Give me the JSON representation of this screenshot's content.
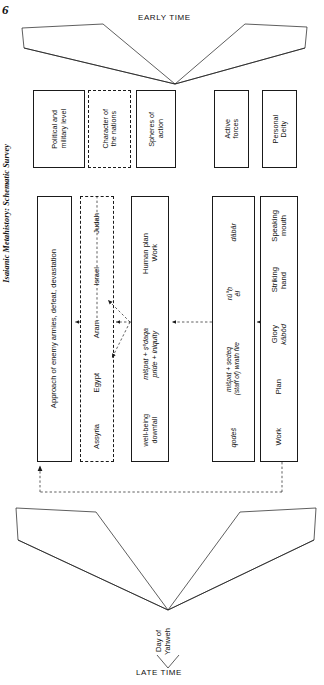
{
  "figure": {
    "number": "6",
    "caption": "Isaianic Metahistory: Schematic Survey"
  },
  "timeline": {
    "top_label": "EARLY TIME",
    "bottom_label": "LATE TIME",
    "apex_label_line1": "Day of",
    "apex_label_line2": "Yahweh"
  },
  "header_row": {
    "items": [
      {
        "id": "political-military-level",
        "line1": "Political and",
        "line2": "military level",
        "style": "solid"
      },
      {
        "id": "character-of-the-nations",
        "line1": "Character of",
        "line2": "the nations",
        "style": "dashed"
      },
      {
        "id": "spheres-of-action",
        "line1": "Spheres of",
        "line2": "action",
        "style": "solid"
      },
      {
        "id": "active-forces",
        "line1": "Active",
        "line2": "forces",
        "style": "solid"
      },
      {
        "id": "personal-deity",
        "line1": "Personal",
        "line2": "Deity",
        "style": "solid"
      }
    ]
  },
  "main_row": {
    "consequences": {
      "id": "approach-of-enemy-armies",
      "text": "Approach of enemy armies, defeat, devastation",
      "style": "solid"
    },
    "nations": {
      "id": "nations-list",
      "style": "dashed",
      "items": [
        "Judah",
        "Israel",
        "Aram",
        "Egypt",
        "Assyria"
      ]
    },
    "human_sphere": {
      "id": "human-plan-work",
      "style": "solid",
      "segments": [
        {
          "line1": "Human plan",
          "line2": "Work",
          "italic": false
        },
        {
          "line1": "mišpaṭ + ṣᵉdaqa",
          "line2": "pride + iniquity",
          "italic": true
        },
        {
          "line1": "well-being",
          "line2": "downfall",
          "italic": false
        }
      ]
    },
    "active_forces": {
      "id": "active-forces-terms",
      "style": "solid",
      "segments": [
        {
          "line1": "dābār",
          "line2": "",
          "italic": true
        },
        {
          "line1": "rū°ḥ",
          "line2": "ēl",
          "italic": true
        },
        {
          "line1": "mišpaṭ + ṣedeq",
          "line2": "(staff of) wrath fire",
          "italic": true
        },
        {
          "line1": "qodeš",
          "line2": "",
          "italic": true
        }
      ]
    },
    "deity": {
      "id": "deity-attributes",
      "style": "solid",
      "segments": [
        {
          "line1": "Speaking",
          "line2": "mouth",
          "italic": false
        },
        {
          "line1": "Striking",
          "line2": "hand",
          "italic": false
        },
        {
          "line1": "Glory",
          "line2": "kābôd",
          "italic": "second"
        },
        {
          "line1": "Plan",
          "line2": "",
          "italic": false
        },
        {
          "line1": "Work",
          "line2": "",
          "italic": false
        }
      ]
    }
  }
}
